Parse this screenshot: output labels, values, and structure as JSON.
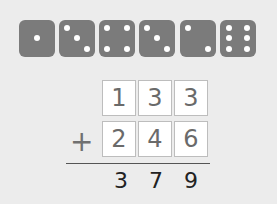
{
  "dice": [
    1,
    3,
    4,
    3,
    2,
    6
  ],
  "addition": {
    "row1": [
      "1",
      "3",
      "3"
    ],
    "row2": [
      "2",
      "4",
      "6"
    ],
    "operator": "+",
    "result": [
      "3",
      "7",
      "9"
    ]
  },
  "colors": {
    "die": "#7b7b7b",
    "background": "#ececec",
    "box_border": "#bdbdbd"
  }
}
